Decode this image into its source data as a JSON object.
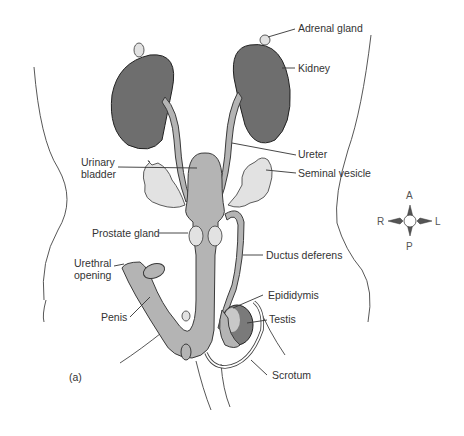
{
  "figure": {
    "panel_label": "(a)",
    "labels": {
      "adrenal_gland": "Adrenal gland",
      "kidney": "Kidney",
      "ureter": "Ureter",
      "urinary_bladder_line1": "Urinary",
      "urinary_bladder_line2": "bladder",
      "seminal_vesicle": "Seminal vesicle",
      "prostate_gland": "Prostate gland",
      "urethral_opening_line1": "Urethral",
      "urethral_opening_line2": "opening",
      "ductus_deferens": "Ductus deferens",
      "penis": "Penis",
      "epididymis": "Epididymis",
      "testis": "Testis",
      "scrotum": "Scrotum"
    },
    "compass": {
      "top": "A",
      "bottom": "P",
      "left": "R",
      "right": "L"
    },
    "colors": {
      "organ_fill": "#b4b4b4",
      "gland_fill": "#e2e2e2",
      "kidney_fill": "#6e6e6e",
      "line": "#333333"
    }
  }
}
